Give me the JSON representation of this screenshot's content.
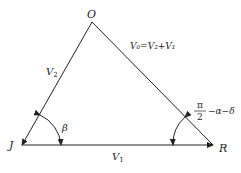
{
  "diagram": {
    "vertices": {
      "O": {
        "label": "O",
        "x": 92,
        "y": 22
      },
      "J": {
        "label": "J",
        "x": 22,
        "y": 145
      },
      "R": {
        "label": "R",
        "x": 213,
        "y": 145
      }
    },
    "edges": {
      "JO": {
        "label_main": "V",
        "label_sub": "2"
      },
      "JR": {
        "label_main": "V",
        "label_sub": "1"
      },
      "OR": {
        "label": "V₀=V₂+V₁"
      }
    },
    "angles": {
      "at_J": {
        "label": "β"
      },
      "at_R": {
        "numerator": "π",
        "denominator": "2",
        "suffix": "−α−δ"
      }
    },
    "colors": {
      "stroke": "#222222",
      "background": "#ffffff"
    }
  }
}
